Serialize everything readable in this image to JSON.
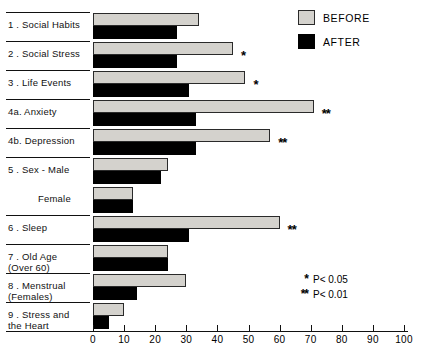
{
  "chart_data": {
    "type": "bar",
    "orientation": "horizontal",
    "title": "",
    "xlabel": "",
    "ylabel": "",
    "xlim": [
      0,
      100
    ],
    "xticks": [
      0,
      10,
      20,
      30,
      40,
      50,
      60,
      70,
      80,
      90,
      100
    ],
    "grid": false,
    "legend_position": "top-right",
    "categories": [
      "1 . Social Habits",
      "2 . Social Stress",
      "3 . Life Events",
      "4a. Anxiety",
      "4b. Depression",
      "5 . Sex - Male",
      "Female",
      "6 . Sleep",
      "7 . Old Age\n(Over 60)",
      "8 . Menstrual\n(Females)",
      "9 . Stress and\nthe Heart"
    ],
    "series": [
      {
        "name": "BEFORE",
        "color": "#d4d2cd",
        "values": [
          34,
          45,
          49,
          71,
          57,
          24,
          13,
          60,
          24,
          30,
          10
        ]
      },
      {
        "name": "AFTER",
        "color": "#000000",
        "values": [
          27,
          27,
          31,
          33,
          33,
          22,
          13,
          31,
          24,
          14,
          5
        ]
      }
    ],
    "significance": [
      "",
      "*",
      "*",
      "**",
      "**",
      "",
      "",
      "**",
      "",
      "",
      ""
    ],
    "annotations": [
      "* P< 0.05",
      "** P< 0.01"
    ]
  },
  "legend": {
    "items": [
      {
        "label": "BEFORE",
        "swatch": "before"
      },
      {
        "label": "AFTER",
        "swatch": "after"
      }
    ]
  },
  "notes": [
    {
      "star": "*",
      "text": "P< 0.05"
    },
    {
      "star": "**",
      "text": "P< 0.01"
    }
  ]
}
